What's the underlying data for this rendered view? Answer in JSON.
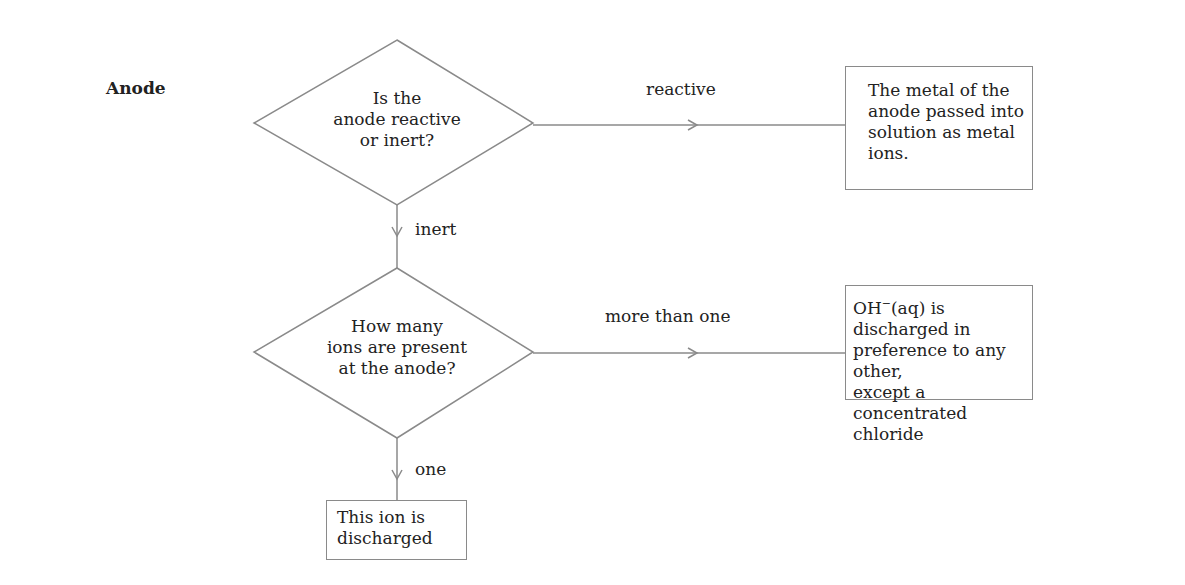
{
  "section_label": "Anode",
  "decisions": [
    {
      "lines": [
        "Is the",
        "anode reactive",
        "or inert?"
      ]
    },
    {
      "lines": [
        "How many",
        "ions are present",
        "at the anode?"
      ]
    }
  ],
  "edge_labels": {
    "reactive": "reactive",
    "inert": "inert",
    "more_than_one": "more than one",
    "one": "one"
  },
  "outcomes": {
    "reactive": "The metal of the\nanode passed into\nsolution as metal\nions.",
    "more_than_one_prefix": "OH",
    "more_than_one_sup": "−",
    "more_than_one_rest": "(aq) is discharged in\npreference to any other,\nexcept a concentrated\nchloride",
    "one": "This ion is\ndischarged"
  },
  "colors": {
    "line": "#8a8a8a",
    "text": "#222222"
  }
}
